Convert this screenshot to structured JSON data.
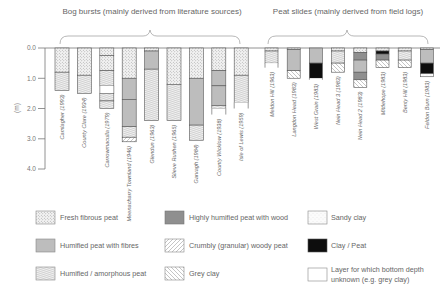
{
  "titles": {
    "bog_bursts": "Bog bursts (mainly derived from literature sources)",
    "peat_slides": "Peat slides (mainly derived from field logs)"
  },
  "axis": {
    "ylabel": "(m)",
    "ticks": [
      "0.0",
      "1.0",
      "2.0",
      "3.0",
      "4.0"
    ]
  },
  "legend": [
    {
      "key": "fresh",
      "label": "Fresh fibrous peat"
    },
    {
      "key": "humfib",
      "label": "Humified peat with fibres"
    },
    {
      "key": "amorph",
      "label": "Humified / amorphous peat"
    },
    {
      "key": "wood",
      "label": "Highly humified peat with wood"
    },
    {
      "key": "crumbly",
      "label": "Crumbly (granular) woody peat"
    },
    {
      "key": "greyclay",
      "label": "Grey clay"
    },
    {
      "key": "sandy",
      "label": "Sandy clay"
    },
    {
      "key": "claypeat",
      "label": "Clay / Peat"
    },
    {
      "key": "unknown",
      "label": "Layer for which bottom depth unknown (e.g. grey clay)",
      "label_line1": "Layer for which bottom depth",
      "label_line2": "unknown (e.g. grey clay)"
    }
  ],
  "chart_data": {
    "type": "table",
    "ylabel": "Depth (m)",
    "ylim": [
      0,
      4
    ],
    "groups": [
      {
        "name": "Bog bursts (mainly derived from literature sources)",
        "columns": [
          {
            "label": "Camlagher (1993)",
            "layers": [
              {
                "type": "fresh",
                "from": 0,
                "to": 0.8
              },
              {
                "type": "amorph",
                "from": 0.8,
                "to": 1.4
              }
            ]
          },
          {
            "label": "County Clare (1934)",
            "layers": [
              {
                "type": "fresh",
                "from": 0,
                "to": 0.9
              },
              {
                "type": "amorph",
                "from": 0.9,
                "to": 1.5
              }
            ]
          },
          {
            "label": "Carrowmaculla (1979)",
            "layers": [
              {
                "type": "fresh",
                "from": 0,
                "to": 0.25
              },
              {
                "type": "fresh",
                "from": 0.25,
                "to": 0.75
              },
              {
                "type": "amorph",
                "from": 0.75,
                "to": 1.25
              },
              {
                "type": "unknown",
                "from": 1.25,
                "to": 1.5
              },
              {
                "type": "amorph",
                "from": 1.5,
                "to": 1.75
              },
              {
                "type": "amorph",
                "from": 1.75,
                "to": 2.0
              }
            ]
          },
          {
            "label": "Meenacharry Townland (1946)",
            "layers": [
              {
                "type": "fresh",
                "from": 0,
                "to": 1.0
              },
              {
                "type": "humfib",
                "from": 1.0,
                "to": 1.7
              },
              {
                "type": "humfib",
                "from": 1.7,
                "to": 2.6
              },
              {
                "type": "amorph",
                "from": 2.6,
                "to": 2.95
              },
              {
                "type": "crumbly",
                "from": 2.95,
                "to": 3.1
              }
            ]
          },
          {
            "label": "Glendun (1963)",
            "layers": [
              {
                "type": "fresh",
                "from": 0,
                "to": 0.1
              },
              {
                "type": "humfib",
                "from": 0.1,
                "to": 0.7
              },
              {
                "type": "amorph",
                "from": 0.7,
                "to": 2.4
              }
            ]
          },
          {
            "label": "Slieve Rushen (1965)",
            "layers": [
              {
                "type": "fresh",
                "from": 0,
                "to": 1.2
              },
              {
                "type": "amorph",
                "from": 1.2,
                "to": 2.4
              }
            ]
          },
          {
            "label": "Garvagh (1984)",
            "layers": [
              {
                "type": "fresh",
                "from": 0,
                "to": 1.0
              },
              {
                "type": "humfib",
                "from": 1.0,
                "to": 2.55
              },
              {
                "type": "amorph",
                "from": 2.55,
                "to": 3.05
              }
            ]
          },
          {
            "label": "County Wicklow (1938)",
            "layers": [
              {
                "type": "fresh",
                "from": 0,
                "to": 0.75
              },
              {
                "type": "humfib",
                "from": 0.75,
                "to": 1.25
              },
              {
                "type": "humfib",
                "from": 1.25,
                "to": 1.9
              },
              {
                "type": "amorph",
                "from": 1.9,
                "to": 2.0
              },
              {
                "type": "unknown",
                "from": 2.0,
                "to": 2.2
              }
            ]
          },
          {
            "label": "Isle of Lewis (1959)",
            "layers": [
              {
                "type": "fresh",
                "from": 0,
                "to": 0.9
              },
              {
                "type": "amorph",
                "from": 0.9,
                "to": 1.8
              },
              {
                "type": "unknown",
                "from": 1.8,
                "to": 2.0
              }
            ]
          }
        ]
      },
      {
        "name": "Peat slides (mainly derived from field logs)",
        "columns": [
          {
            "label": "Meldon Hill (1963)",
            "layers": [
              {
                "type": "fresh",
                "from": 0,
                "to": 0.1
              },
              {
                "type": "amorph",
                "from": 0.1,
                "to": 0.5
              },
              {
                "type": "unknown",
                "from": 0.5,
                "to": 0.65
              }
            ]
          },
          {
            "label": "Langdon Head (1983)",
            "layers": [
              {
                "type": "fresh",
                "from": 0,
                "to": 0.05
              },
              {
                "type": "humfib",
                "from": 0.05,
                "to": 0.75
              },
              {
                "type": "greyclay",
                "from": 0.75,
                "to": 1.0
              }
            ]
          },
          {
            "label": "West Grain (1983)",
            "layers": [
              {
                "type": "humfib",
                "from": 0,
                "to": 0.5
              },
              {
                "type": "claypeat",
                "from": 0.5,
                "to": 1.0
              },
              {
                "type": "unknown",
                "from": 1.0,
                "to": 1.05
              }
            ]
          },
          {
            "label": "Nein Head 3 (1983)",
            "layers": [
              {
                "type": "fresh",
                "from": 0,
                "to": 0.1
              },
              {
                "type": "amorph",
                "from": 0.1,
                "to": 0.5
              },
              {
                "type": "greyclay",
                "from": 0.5,
                "to": 0.8
              }
            ]
          },
          {
            "label": "Nein Head 2 (1983)",
            "layers": [
              {
                "type": "fresh",
                "from": 0,
                "to": 0.15
              },
              {
                "type": "wood",
                "from": 0.15,
                "to": 0.4
              },
              {
                "type": "humfib",
                "from": 0.4,
                "to": 0.8
              },
              {
                "type": "wood",
                "from": 0.8,
                "to": 1.05
              },
              {
                "type": "greyclay",
                "from": 1.05,
                "to": 1.3
              }
            ]
          },
          {
            "label": "Mittlehope (1983)",
            "layers": [
              {
                "type": "fresh",
                "from": 0,
                "to": 0.1
              },
              {
                "type": "claypeat",
                "from": 0.1,
                "to": 0.2
              },
              {
                "type": "wood",
                "from": 0.2,
                "to": 0.4
              },
              {
                "type": "greyclay",
                "from": 0.4,
                "to": 0.65
              }
            ]
          },
          {
            "label": "Benty Hill (1983)",
            "layers": [
              {
                "type": "fresh",
                "from": 0,
                "to": 0.1
              },
              {
                "type": "amorph",
                "from": 0.1,
                "to": 0.4
              },
              {
                "type": "greyclay",
                "from": 0.4,
                "to": 0.65
              }
            ]
          },
          {
            "label": "Feldon Burn (1983)",
            "layers": [
              {
                "type": "fresh",
                "from": 0,
                "to": 0.05
              },
              {
                "type": "humfib",
                "from": 0.05,
                "to": 0.5
              },
              {
                "type": "claypeat",
                "from": 0.5,
                "to": 0.85
              },
              {
                "type": "sandy",
                "from": 0.85,
                "to": 0.95
              }
            ]
          }
        ]
      }
    ]
  }
}
